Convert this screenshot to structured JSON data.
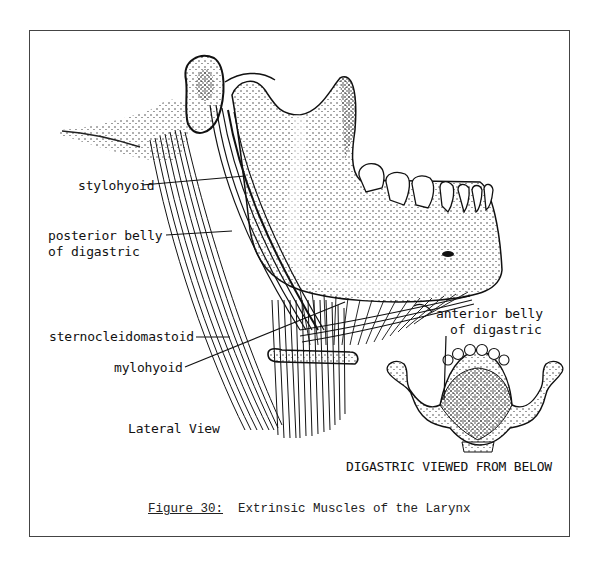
{
  "figure": {
    "number_label": "Figure 30:",
    "title": "Extrinsic Muscles of the Larynx"
  },
  "labels": {
    "stylohyoid": "stylohyoid",
    "posterior_belly_line1": "posterior belly",
    "posterior_belly_line2": "of digastric",
    "sternocleidomastoid": "sternocleidomastoid",
    "mylohyoid": "mylohyoid",
    "anterior_belly_line1": "anterior belly",
    "anterior_belly_line2": "of digastric",
    "lateral_view": "Lateral View",
    "inferior_view": "DIGASTRIC VIEWED FROM BELOW"
  },
  "colors": {
    "ink": "#111111",
    "frame": "#444444",
    "paper": "#ffffff"
  }
}
